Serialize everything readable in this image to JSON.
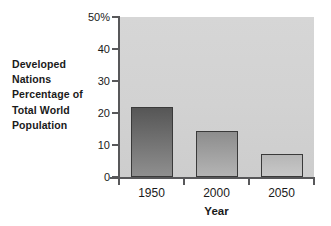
{
  "caption": {
    "lines": [
      "Developed",
      "Nations",
      "Percentage of",
      "Total World",
      "Population"
    ]
  },
  "chart_data": {
    "type": "bar",
    "title": "",
    "subtitle": "",
    "categories": [
      "1950",
      "2000",
      "2050"
    ],
    "values": [
      22,
      14.5,
      7.2
    ],
    "series": [
      {
        "name": "Developed Nations Percentage of Total World Population",
        "values": [
          22,
          14.5,
          7.2
        ]
      }
    ],
    "xlabel": "Year",
    "ylabel": "Developed Nations Percentage of Total World Population",
    "ylim": [
      0,
      50
    ],
    "yticks": [
      0,
      10,
      20,
      30,
      40,
      50
    ],
    "ytick_labels": [
      "0",
      "10",
      "20",
      "30",
      "40",
      "50%"
    ],
    "xtick_labels": [
      "1950",
      "2000",
      "2050"
    ],
    "grid": false,
    "legend": false,
    "legend_position": "none",
    "unit": "%",
    "annotations": []
  },
  "colors": {
    "plot_background": "#d3d3d3",
    "bar_outline": "#3a3a3a",
    "bar1_top": "#565656",
    "bar1_bottom": "#8f8f8f",
    "bar2_top": "#8d8d8d",
    "bar2_bottom": "#b4b4b4",
    "bar3_top": "#b6b6b6",
    "bar3_bottom": "#c8c8c8",
    "axis": "#58585a",
    "text": "#1a1a1a",
    "page_background": "#ffffff"
  }
}
